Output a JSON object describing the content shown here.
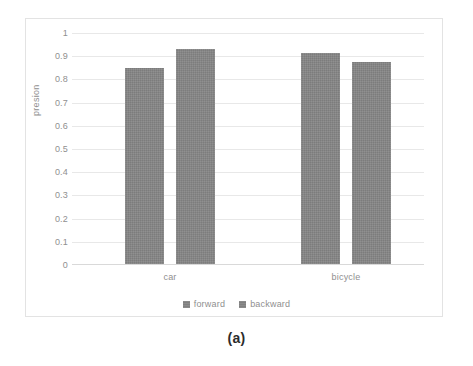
{
  "caption": "(a)",
  "chart_data": {
    "type": "bar",
    "title": "",
    "subtitle": "",
    "xlabel": "",
    "ylabel": "presion",
    "categories": [
      "car",
      "bicycle"
    ],
    "series": [
      {
        "name": "forward",
        "values": [
          0.85,
          0.915
        ]
      },
      {
        "name": "backward",
        "values": [
          0.93,
          0.875
        ]
      }
    ],
    "ylim": [
      0,
      1
    ],
    "ytick_values": [
      1,
      0.9,
      0.8,
      0.7,
      0.6,
      0.5,
      0.4,
      0.3,
      0.2,
      0.1,
      0
    ],
    "ytick_labels": [
      "1",
      "0.9",
      "0.8",
      "0.7",
      "0.6",
      "0.5",
      "0.4",
      "0.3",
      "0.2",
      "0.1",
      "0"
    ],
    "grid": true,
    "legend_position": "bottom",
    "bar_color": "#858585",
    "gridline_color": "#e8e8e8",
    "axis_text_color": "#8f8f8f",
    "frame_color": "#e3e3e3"
  }
}
